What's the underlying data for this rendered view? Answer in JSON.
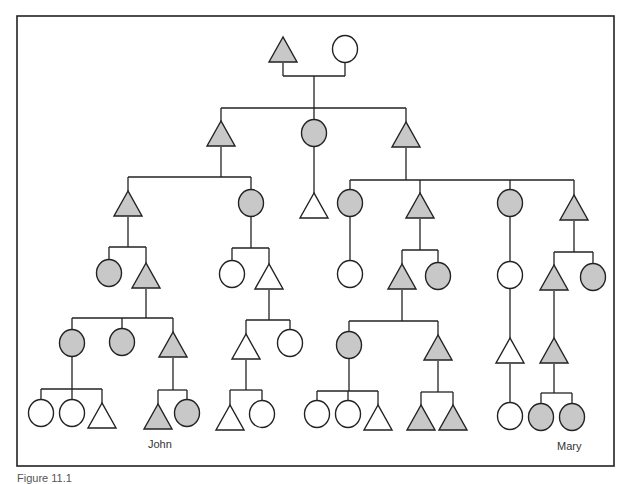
{
  "diagram": {
    "type": "kinship-chart",
    "colors": {
      "line": "#222222",
      "shaded": "#c8c8c8",
      "unshaded": "#ffffff",
      "frame": "#222222"
    },
    "frame": {
      "x": 17,
      "y": 16,
      "w": 597,
      "h": 450
    },
    "legend_semantics": {
      "triangle": "male",
      "circle": "female",
      "shaded": "member of descent group",
      "unshaded": "not member"
    },
    "nodes": [
      {
        "id": "g1-m",
        "shape": "triangle",
        "x": 283,
        "y": 50,
        "shaded": true
      },
      {
        "id": "g1-f",
        "shape": "circle",
        "x": 345,
        "y": 49,
        "shaded": false
      },
      {
        "id": "g2-a",
        "shape": "triangle",
        "x": 221,
        "y": 134,
        "shaded": true
      },
      {
        "id": "g2-b",
        "shape": "circle",
        "x": 314,
        "y": 133,
        "shaded": true
      },
      {
        "id": "g2-c",
        "shape": "triangle",
        "x": 406,
        "y": 135,
        "shaded": true
      },
      {
        "id": "g3-a",
        "shape": "triangle",
        "x": 128,
        "y": 204,
        "shaded": true
      },
      {
        "id": "g3-b",
        "shape": "circle",
        "x": 251,
        "y": 203,
        "shaded": true
      },
      {
        "id": "g3-c",
        "shape": "triangle",
        "x": 314,
        "y": 206,
        "shaded": false
      },
      {
        "id": "g3-d",
        "shape": "circle",
        "x": 350,
        "y": 203,
        "shaded": true
      },
      {
        "id": "g3-e",
        "shape": "triangle",
        "x": 420,
        "y": 206,
        "shaded": true
      },
      {
        "id": "g3-f",
        "shape": "circle",
        "x": 510,
        "y": 203,
        "shaded": true
      },
      {
        "id": "g3-g",
        "shape": "triangle",
        "x": 574,
        "y": 208,
        "shaded": true
      },
      {
        "id": "g4-a",
        "shape": "circle",
        "x": 109,
        "y": 273,
        "shaded": true
      },
      {
        "id": "g4-b",
        "shape": "triangle",
        "x": 146,
        "y": 276,
        "shaded": true
      },
      {
        "id": "g4-c",
        "shape": "circle",
        "x": 232,
        "y": 274,
        "shaded": false
      },
      {
        "id": "g4-d",
        "shape": "triangle",
        "x": 269,
        "y": 277,
        "shaded": false
      },
      {
        "id": "g4-e",
        "shape": "circle",
        "x": 350,
        "y": 274,
        "shaded": false
      },
      {
        "id": "g4-f",
        "shape": "triangle",
        "x": 402,
        "y": 277,
        "shaded": true
      },
      {
        "id": "g4-g",
        "shape": "circle",
        "x": 438,
        "y": 276,
        "shaded": true
      },
      {
        "id": "g4-h",
        "shape": "circle",
        "x": 510,
        "y": 275,
        "shaded": false
      },
      {
        "id": "g4-i",
        "shape": "triangle",
        "x": 554,
        "y": 278,
        "shaded": true
      },
      {
        "id": "g4-j",
        "shape": "circle",
        "x": 593,
        "y": 277,
        "shaded": true
      },
      {
        "id": "g5-a",
        "shape": "circle",
        "x": 72,
        "y": 343,
        "shaded": true
      },
      {
        "id": "g5-b",
        "shape": "circle",
        "x": 122,
        "y": 342,
        "shaded": true
      },
      {
        "id": "g5-c",
        "shape": "triangle",
        "x": 173,
        "y": 345,
        "shaded": true
      },
      {
        "id": "g5-d",
        "shape": "triangle",
        "x": 246,
        "y": 347,
        "shaded": false
      },
      {
        "id": "g5-e",
        "shape": "circle",
        "x": 290,
        "y": 343,
        "shaded": false
      },
      {
        "id": "g5-f",
        "shape": "circle",
        "x": 349,
        "y": 345,
        "shaded": true
      },
      {
        "id": "g5-g",
        "shape": "triangle",
        "x": 438,
        "y": 348,
        "shaded": true
      },
      {
        "id": "g5-h",
        "shape": "triangle",
        "x": 510,
        "y": 351,
        "shaded": false
      },
      {
        "id": "g5-i",
        "shape": "triangle",
        "x": 554,
        "y": 351,
        "shaded": true
      },
      {
        "id": "g6-a",
        "shape": "circle",
        "x": 41,
        "y": 413,
        "shaded": false
      },
      {
        "id": "g6-b",
        "shape": "circle",
        "x": 72,
        "y": 413,
        "shaded": false
      },
      {
        "id": "g6-c",
        "shape": "triangle",
        "x": 102,
        "y": 416,
        "shaded": false
      },
      {
        "id": "g6-john",
        "shape": "triangle",
        "x": 158,
        "y": 417,
        "shaded": true
      },
      {
        "id": "g6-e",
        "shape": "circle",
        "x": 187,
        "y": 413,
        "shaded": true
      },
      {
        "id": "g6-f",
        "shape": "triangle",
        "x": 230,
        "y": 418,
        "shaded": false
      },
      {
        "id": "g6-g",
        "shape": "circle",
        "x": 262,
        "y": 414,
        "shaded": false
      },
      {
        "id": "g6-h",
        "shape": "circle",
        "x": 317,
        "y": 414,
        "shaded": false
      },
      {
        "id": "g6-i",
        "shape": "circle",
        "x": 348,
        "y": 414,
        "shaded": false
      },
      {
        "id": "g6-j",
        "shape": "triangle",
        "x": 378,
        "y": 418,
        "shaded": false
      },
      {
        "id": "g6-k",
        "shape": "triangle",
        "x": 421,
        "y": 418,
        "shaded": true
      },
      {
        "id": "g6-l",
        "shape": "triangle",
        "x": 453,
        "y": 418,
        "shaded": true
      },
      {
        "id": "g6-m",
        "shape": "circle",
        "x": 510,
        "y": 416,
        "shaded": false
      },
      {
        "id": "g6-n",
        "shape": "circle",
        "x": 541,
        "y": 417,
        "shaded": true
      },
      {
        "id": "g6-mary",
        "shape": "circle",
        "x": 572,
        "y": 417,
        "shaded": true
      }
    ],
    "families": [
      {
        "parent": [
          283,
          345
        ],
        "parentY": 63,
        "barY": 76,
        "stemX": 314,
        "sibBarY": 108,
        "children": [
          221,
          314,
          406
        ],
        "childTops": [
          121,
          120,
          122
        ]
      },
      {
        "parentX": 221,
        "parentBottom": 147,
        "sibBarY": 177,
        "children": [
          128,
          251
        ],
        "childTops": [
          191,
          190
        ]
      },
      {
        "parentX": 314,
        "parentBottom": 147,
        "children": [
          314
        ],
        "childTops": [
          193
        ],
        "direct": true
      },
      {
        "parentX": 406,
        "parentBottom": 148,
        "sibBarY": 180,
        "children": [
          350,
          420,
          510,
          574
        ],
        "childTops": [
          190,
          193,
          190,
          195
        ]
      },
      {
        "parentX": 128,
        "parentBottom": 217,
        "sibBarY": 247,
        "children": [
          109,
          146
        ],
        "childTops": [
          260,
          263
        ]
      },
      {
        "parentX": 251,
        "parentBottom": 217,
        "sibBarY": 248,
        "children": [
          232,
          269
        ],
        "childTops": [
          261,
          264
        ]
      },
      {
        "parentX": 350,
        "parentBottom": 217,
        "children": [
          350
        ],
        "childTops": [
          261
        ],
        "direct": true
      },
      {
        "parentX": 420,
        "parentBottom": 219,
        "sibBarY": 250,
        "children": [
          402,
          438
        ],
        "childTops": [
          264,
          263
        ]
      },
      {
        "parentX": 510,
        "parentBottom": 217,
        "children": [
          510
        ],
        "childTops": [
          262
        ],
        "direct": true
      },
      {
        "parentX": 574,
        "parentBottom": 221,
        "sibBarY": 252,
        "children": [
          554,
          593
        ],
        "childTops": [
          265,
          264
        ]
      },
      {
        "parentX": 146,
        "parentBottom": 289,
        "sibBarY": 318,
        "children": [
          72,
          122,
          173
        ],
        "childTops": [
          330,
          329,
          332
        ]
      },
      {
        "parentX": 269,
        "parentBottom": 290,
        "sibBarY": 320,
        "children": [
          246,
          290
        ],
        "childTops": [
          334,
          330
        ]
      },
      {
        "parentX": 402,
        "parentBottom": 290,
        "sibBarY": 321,
        "children": [
          349,
          438
        ],
        "childTops": [
          332,
          335
        ]
      },
      {
        "parentX": 510,
        "parentBottom": 289,
        "children": [
          510
        ],
        "childTops": [
          338
        ],
        "direct": true
      },
      {
        "parentX": 554,
        "parentBottom": 291,
        "children": [
          554
        ],
        "childTops": [
          338
        ],
        "direct": true
      },
      {
        "parentX": 72,
        "parentBottom": 357,
        "sibBarY": 389,
        "children": [
          41,
          72,
          102
        ],
        "childTops": [
          400,
          400,
          403
        ]
      },
      {
        "parentX": 173,
        "parentBottom": 358,
        "sibBarY": 390,
        "children": [
          158,
          187
        ],
        "childTops": [
          404,
          400
        ]
      },
      {
        "parentX": 246,
        "parentBottom": 360,
        "sibBarY": 390,
        "children": [
          230,
          262
        ],
        "childTops": [
          405,
          401
        ]
      },
      {
        "parentX": 349,
        "parentBottom": 359,
        "sibBarY": 391,
        "children": [
          317,
          348,
          378
        ],
        "childTops": [
          401,
          401,
          405
        ]
      },
      {
        "parentX": 438,
        "parentBottom": 361,
        "sibBarY": 392,
        "children": [
          421,
          453
        ],
        "childTops": [
          405,
          405
        ]
      },
      {
        "parentX": 510,
        "parentBottom": 364,
        "children": [
          510
        ],
        "childTops": [
          403
        ],
        "direct": true
      },
      {
        "parentX": 554,
        "parentBottom": 364,
        "sibBarY": 393,
        "children": [
          541,
          572
        ],
        "childTops": [
          404,
          404
        ]
      }
    ],
    "labels": {
      "john": "John",
      "mary": "Mary"
    },
    "caption": "Figure 11.1"
  }
}
